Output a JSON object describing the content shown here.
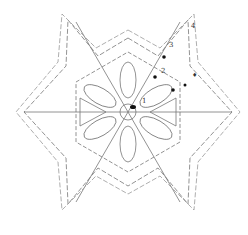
{
  "diagram": {
    "type": "crochet-chart",
    "shape": "six-point star",
    "center": [
      128,
      112
    ],
    "round_labels": [
      {
        "text": "1",
        "x": 144,
        "y": 101
      },
      {
        "text": "2",
        "x": 162,
        "y": 71
      },
      {
        "text": "3",
        "x": 170,
        "y": 45
      },
      {
        "text": "4",
        "x": 192,
        "y": 26
      },
      {
        "text": "♦",
        "x": 193,
        "y": 75
      }
    ],
    "colors": {
      "line": "#666666",
      "dark": "#111111",
      "bg": "#ffffff"
    }
  }
}
